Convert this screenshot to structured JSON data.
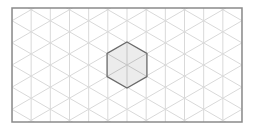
{
  "diagram": {
    "type": "isometric-grid",
    "frame": {
      "x": 12,
      "y": 8,
      "width": 230,
      "height": 114,
      "stroke": "#8a8a8a"
    },
    "grid": {
      "column_spacing": 19.17,
      "origin_x": 127,
      "origin_y": 65,
      "stroke": "#d9d9d9"
    },
    "hexagon": {
      "center_x": 127,
      "center_y": 65,
      "radius": 23,
      "fill": "#ececec",
      "stroke": "#6a6a6a",
      "inner_stroke": "#c4c4c4"
    }
  }
}
